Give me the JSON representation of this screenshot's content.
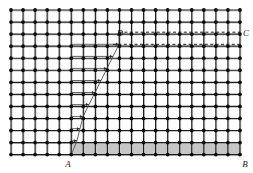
{
  "figure": {
    "type": "lattice-grid-diagram",
    "width": 253,
    "height": 173,
    "background": "#ffffff"
  },
  "grid": {
    "origin_x": 11,
    "origin_y": 10,
    "cell": 12.05,
    "cols": 19,
    "rows": 12,
    "line_color": "#1c1c1c",
    "line_width": 1.15,
    "node_color": "#0d0d0d",
    "node_radius": 1.9,
    "shadow_color": "#c9c9c9"
  },
  "labels": [
    {
      "id": "label-A",
      "text": "A",
      "x": 68,
      "y": 167,
      "anchor": "middle"
    },
    {
      "id": "label-B",
      "text": "B",
      "x": 245,
      "y": 167,
      "anchor": "middle"
    },
    {
      "id": "label-C",
      "text": "C",
      "x": 246,
      "y": 36,
      "anchor": "middle"
    },
    {
      "id": "label-D",
      "text": "D",
      "x": 120,
      "y": 36,
      "anchor": "middle"
    }
  ],
  "shaded_band": {
    "id": "shaded-strip-AB",
    "x": 70,
    "y": 143,
    "width": 170,
    "height": 12,
    "fill": "#c6c6c6",
    "stroke": "#8a8a8a"
  },
  "dashed_lines": [
    {
      "id": "dash-DC-upper",
      "x1": 119,
      "y1": 32.2,
      "x2": 240,
      "y2": 32.2
    },
    {
      "id": "dash-DC-lower",
      "x1": 113,
      "y1": 44.3,
      "x2": 240,
      "y2": 44.3
    }
  ],
  "dash_style": {
    "color": "#1c1c1c",
    "width": 1.0,
    "pattern": "3,2.4"
  },
  "zigzag": {
    "id": "zigzag-path",
    "color": "#4a4a4a",
    "width": 0.85,
    "arrow_color": "#2a2a2a",
    "description": "Alternating rightward horizontal arrows and diagonal return segments forming a staircase between A and D",
    "rows": [
      {
        "y": 44.3,
        "x_start": 71.2,
        "x_end": 119.0
      },
      {
        "y": 56.4,
        "x_start": 71.2,
        "x_end": 113.0
      },
      {
        "y": 68.4,
        "x_start": 71.2,
        "x_end": 107.0
      },
      {
        "y": 80.5,
        "x_start": 71.2,
        "x_end": 101.0
      },
      {
        "y": 92.5,
        "x_start": 71.2,
        "x_end": 95.0
      },
      {
        "y": 104.6,
        "x_start": 71.2,
        "x_end": 89.0
      },
      {
        "y": 116.6,
        "x_start": 71.2,
        "x_end": 83.0
      },
      {
        "y": 128.7,
        "x_start": 71.2,
        "x_end": 80.0
      },
      {
        "y": 140.7,
        "x_start": 71.2,
        "x_end": 77.0
      }
    ],
    "apex": {
      "x": 119.0,
      "y": 32.2
    },
    "base": {
      "x": 71.2,
      "y": 155.0
    }
  }
}
